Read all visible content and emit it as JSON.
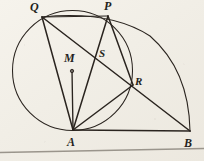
{
  "figure": {
    "background_color": "#f4f1ea",
    "ink_color": "#2a241f",
    "rule_color": "#9a958c",
    "view": {
      "width": 204,
      "height": 161
    },
    "points": [
      {
        "name": "Q",
        "label": "Q",
        "x": 42,
        "y": 17,
        "label_x": 30,
        "label_y": 1
      },
      {
        "name": "P",
        "label": "P",
        "x": 108,
        "y": 16,
        "label_x": 104,
        "label_y": 0
      },
      {
        "name": "S",
        "label": "S",
        "x": 97,
        "y": 57,
        "label_x": 99,
        "label_y": 48
      },
      {
        "name": "M",
        "label": "M",
        "x": 72,
        "y": 70,
        "label_x": 64,
        "label_y": 52
      },
      {
        "name": "R",
        "label": "R",
        "x": 133,
        "y": 85,
        "label_x": 135,
        "label_y": 76
      },
      {
        "name": "A",
        "label": "A",
        "x": 73,
        "y": 130,
        "label_x": 67,
        "label_y": 136
      },
      {
        "name": "B",
        "label": "B",
        "x": 190,
        "y": 131,
        "label_x": 184,
        "label_y": 137
      }
    ],
    "circles": [
      {
        "name": "main-circle",
        "cx": 72.5,
        "cy": 70.5,
        "r": 60.0
      }
    ],
    "arcs": [
      {
        "name": "outer-arc-QPB",
        "path": "M 42 17 Q 110 10 150 36 Q 189 70 190 131"
      }
    ],
    "segments": [
      {
        "name": "segment-QP",
        "from": "Q",
        "to": "P",
        "x1": 42,
        "y1": 17,
        "x2": 108,
        "y2": 16
      },
      {
        "name": "segment-QA",
        "from": "Q",
        "to": "A",
        "x1": 42,
        "y1": 17,
        "x2": 73,
        "y2": 130
      },
      {
        "name": "segment-QB",
        "from": "Q",
        "to": "B",
        "x1": 42,
        "y1": 17,
        "x2": 190,
        "y2": 131
      },
      {
        "name": "segment-PA",
        "from": "P",
        "to": "A",
        "x1": 108,
        "y1": 16,
        "x2": 73,
        "y2": 130
      },
      {
        "name": "segment-PR",
        "from": "P",
        "to": "R",
        "x1": 108,
        "y1": 16,
        "x2": 133,
        "y2": 85
      },
      {
        "name": "segment-RA",
        "from": "R",
        "to": "A",
        "x1": 133,
        "y1": 85,
        "x2": 73,
        "y2": 130
      },
      {
        "name": "segment-MA",
        "from": "M",
        "to": "A",
        "x1": 72,
        "y1": 70,
        "x2": 73,
        "y2": 130
      },
      {
        "name": "segment-AB",
        "from": "A",
        "to": "B",
        "x1": 73,
        "y1": 130,
        "x2": 190,
        "y2": 131
      }
    ],
    "center_marker": {
      "name": "center-dot-M",
      "cx": 72,
      "cy": 71,
      "r": 1.8
    },
    "page_rule": {
      "name": "page-rule-line",
      "x1": 0,
      "y1": 152,
      "x2": 204,
      "y2": 148
    }
  }
}
